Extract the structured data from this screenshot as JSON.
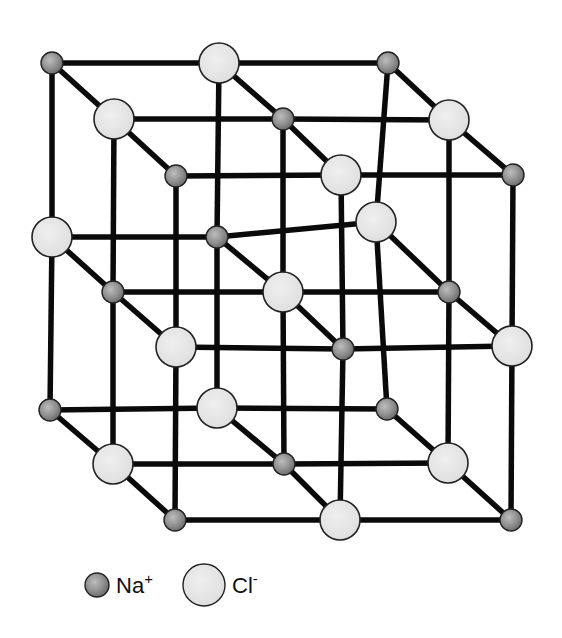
{
  "diagram": {
    "colors": {
      "na_fill": "#8c8c8c",
      "cl_fill": "#e4e4e4",
      "bond": "#0a0a0a",
      "outline": "#222222"
    },
    "radii": {
      "Na": 11,
      "Cl": 20
    },
    "nodes": [
      {
        "id": "t00",
        "ion": "Na",
        "x": 52,
        "y": 63
      },
      {
        "id": "t01",
        "ion": "Cl",
        "x": 219,
        "y": 63
      },
      {
        "id": "t02",
        "ion": "Na",
        "x": 388,
        "y": 63
      },
      {
        "id": "t10",
        "ion": "Cl",
        "x": 114,
        "y": 119
      },
      {
        "id": "t11",
        "ion": "Na",
        "x": 283,
        "y": 119
      },
      {
        "id": "t12",
        "ion": "Cl",
        "x": 449,
        "y": 120
      },
      {
        "id": "t20",
        "ion": "Na",
        "x": 176,
        "y": 176
      },
      {
        "id": "t21",
        "ion": "Cl",
        "x": 341,
        "y": 175
      },
      {
        "id": "t22",
        "ion": "Na",
        "x": 513,
        "y": 175
      },
      {
        "id": "m00",
        "ion": "Cl",
        "x": 52,
        "y": 237
      },
      {
        "id": "m01",
        "ion": "Na",
        "x": 217,
        "y": 237
      },
      {
        "id": "m02",
        "ion": "Cl",
        "x": 376,
        "y": 222
      },
      {
        "id": "m10",
        "ion": "Na",
        "x": 113,
        "y": 292
      },
      {
        "id": "m11",
        "ion": "Cl",
        "x": 283,
        "y": 292
      },
      {
        "id": "m12",
        "ion": "Na",
        "x": 449,
        "y": 292
      },
      {
        "id": "m20",
        "ion": "Cl",
        "x": 176,
        "y": 347
      },
      {
        "id": "m21",
        "ion": "Na",
        "x": 343,
        "y": 349
      },
      {
        "id": "m22",
        "ion": "Cl",
        "x": 512,
        "y": 346
      },
      {
        "id": "b00",
        "ion": "Na",
        "x": 50,
        "y": 410
      },
      {
        "id": "b01",
        "ion": "Cl",
        "x": 217,
        "y": 408
      },
      {
        "id": "b02",
        "ion": "Na",
        "x": 387,
        "y": 409
      },
      {
        "id": "b10",
        "ion": "Cl",
        "x": 113,
        "y": 464
      },
      {
        "id": "b11",
        "ion": "Na",
        "x": 284,
        "y": 464
      },
      {
        "id": "b12",
        "ion": "Cl",
        "x": 448,
        "y": 463
      },
      {
        "id": "b20",
        "ion": "Na",
        "x": 175,
        "y": 520
      },
      {
        "id": "b21",
        "ion": "Cl",
        "x": 340,
        "y": 520
      },
      {
        "id": "b22",
        "ion": "Na",
        "x": 511,
        "y": 520
      }
    ]
  },
  "legend": {
    "items": [
      {
        "ion": "Na",
        "symbol": "Na",
        "charge": "+",
        "x": 97,
        "y": 585,
        "r": 12,
        "text_x": 116
      },
      {
        "ion": "Cl",
        "symbol": "Cl",
        "charge": "-",
        "x": 204,
        "y": 585,
        "r": 21,
        "text_x": 232
      }
    ]
  }
}
